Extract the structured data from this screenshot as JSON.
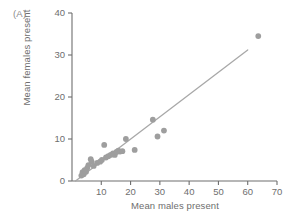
{
  "panel": {
    "label": "(A)"
  },
  "colors": {
    "point": "#9e9e9e",
    "line": "#a8a8a8",
    "axis": "#6e6e6e",
    "text": "#6e6e6e",
    "background": "#ffffff"
  },
  "chart_data": {
    "type": "scatter",
    "title": "",
    "panel_label": "(A)",
    "xlabel": "Mean males present",
    "ylabel": "Mean females present",
    "xlim": [
      0,
      70
    ],
    "ylim": [
      0,
      40
    ],
    "xticks": [
      10,
      20,
      30,
      40,
      50,
      60,
      70
    ],
    "yticks": [
      0,
      10,
      20,
      30,
      40
    ],
    "xtick_labels": [
      "10",
      "20",
      "30",
      "40",
      "50",
      "60",
      "70"
    ],
    "ytick_labels": [
      "0",
      "10",
      "20",
      "30",
      "40"
    ],
    "grid": false,
    "legend": null,
    "marker": "filled-circle",
    "points": [
      [
        3.2,
        1.3
      ],
      [
        3.6,
        2.1
      ],
      [
        4.0,
        1.6
      ],
      [
        4.3,
        2.6
      ],
      [
        4.8,
        2.2
      ],
      [
        5.2,
        3.1
      ],
      [
        5.6,
        3.8
      ],
      [
        6.4,
        5.2
      ],
      [
        6.7,
        4.6
      ],
      [
        7.4,
        3.6
      ],
      [
        8.6,
        4.3
      ],
      [
        9.6,
        4.6
      ],
      [
        10.2,
        5.0
      ],
      [
        11.0,
        8.6
      ],
      [
        11.6,
        5.6
      ],
      [
        12.4,
        5.9
      ],
      [
        13.2,
        6.2
      ],
      [
        14.0,
        6.6
      ],
      [
        14.6,
        6.2
      ],
      [
        15.2,
        6.9
      ],
      [
        15.8,
        7.2
      ],
      [
        16.4,
        7.0
      ],
      [
        17.2,
        7.1
      ],
      [
        18.4,
        10.0
      ],
      [
        21.4,
        7.4
      ],
      [
        27.6,
        14.6
      ],
      [
        29.2,
        10.6
      ],
      [
        31.4,
        12.0
      ],
      [
        63.6,
        34.5
      ]
    ],
    "fit_line": {
      "type": "linear",
      "x_start": 1.2,
      "y_start": 0.0,
      "x_end": 60.0,
      "y_end": 31.2
    }
  },
  "axes_geometry": {
    "x0_px": 72,
    "x70_px": 277,
    "y0_px": 181,
    "y40_px": 13
  }
}
